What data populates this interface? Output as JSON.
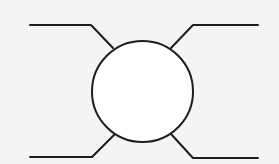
{
  "diagram": {
    "background": "#f4f4f4",
    "stroke": "#1e1e1e",
    "stroke_width": 2,
    "node": {
      "shape": "circle",
      "cx": 142.5,
      "cy": 91.5,
      "r": 50.5,
      "fill": "#ffffff"
    },
    "leads": [
      {
        "id": "top-left",
        "points": "30,25 91,25 113,48"
      },
      {
        "id": "top-right",
        "points": "258,25 193,25 171,48"
      },
      {
        "id": "bottom-left",
        "points": "30,157 92,157 114,135"
      },
      {
        "id": "bottom-right",
        "points": "258,158 193,158 171,134"
      }
    ]
  }
}
